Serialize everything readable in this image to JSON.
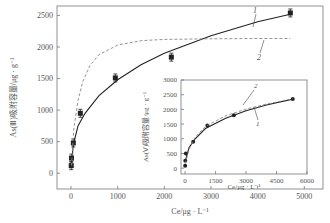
{
  "chart_data": [
    {
      "type": "scatter",
      "title": "",
      "xlabel": "Ce/μg·L⁻¹",
      "ylabel": "As(Ⅲ)吸附容量/μg·g⁻¹",
      "xlim": [
        -300,
        5400
      ],
      "ylim": [
        -250,
        2650
      ],
      "xticks": [
        0,
        1000,
        2000,
        3000,
        4000,
        5000
      ],
      "yticks": [
        0,
        500,
        1000,
        1500,
        2000,
        2500
      ],
      "grid": false,
      "series": [
        {
          "name": "data",
          "x": [
            5,
            10,
            50,
            200,
            950,
            2150,
            4700
          ],
          "y": [
            120,
            240,
            480,
            950,
            1510,
            1840,
            2540
          ],
          "marker": "square"
        },
        {
          "name": "1",
          "style": "solid",
          "x": [
            10,
            50,
            150,
            300,
            600,
            1000,
            1500,
            2000,
            3000,
            4000,
            4700
          ],
          "y": [
            150,
            450,
            750,
            950,
            1230,
            1480,
            1720,
            1900,
            2180,
            2400,
            2520
          ]
        },
        {
          "name": "2",
          "style": "dashed",
          "x": [
            10,
            60,
            150,
            250,
            400,
            600,
            1000,
            1500,
            2000,
            3000,
            4000,
            4700
          ],
          "y": [
            120,
            700,
            1150,
            1450,
            1700,
            1880,
            2030,
            2100,
            2120,
            2130,
            2135,
            2135
          ]
        }
      ],
      "annotations": [
        "1",
        "2"
      ]
    },
    {
      "type": "scatter",
      "title": "",
      "xlabel": "Ce/μg·L⁻¹",
      "ylabel": "As(Ⅴ)吸附容量/μg·g⁻¹",
      "xlim": [
        -200,
        6000
      ],
      "ylim": [
        -200,
        3000
      ],
      "xticks": [
        0,
        1500,
        3000,
        4500,
        6000
      ],
      "yticks": [
        0,
        500,
        1000,
        1500,
        2000,
        2500,
        3000
      ],
      "grid": false,
      "series": [
        {
          "name": "data",
          "x": [
            5,
            10,
            40,
            400,
            1100,
            2400,
            5300
          ],
          "y": [
            80,
            250,
            500,
            900,
            1450,
            1800,
            2350
          ],
          "marker": "circle"
        },
        {
          "name": "1",
          "style": "solid",
          "x": [
            10,
            200,
            500,
            1000,
            2000,
            3000,
            4000,
            5300
          ],
          "y": [
            250,
            700,
            1000,
            1350,
            1700,
            1950,
            2150,
            2350
          ]
        },
        {
          "name": "2",
          "style": "dashed",
          "x": [
            10,
            200,
            500,
            1000,
            2000,
            3000,
            4000,
            5300
          ],
          "y": [
            150,
            650,
            1050,
            1420,
            1780,
            2010,
            2180,
            2360
          ]
        }
      ],
      "annotations": [
        "1",
        "2"
      ]
    }
  ],
  "labels": {
    "main_ylabel": "As(Ⅲ)吸附容量/μg · g⁻¹",
    "main_xlabel": "Ce/μg · L⁻¹",
    "inset_ylabel": "As(Ⅴ)吸附容量/μg · g⁻¹",
    "inset_xlabel": "Ce/μg · L⁻¹",
    "curve1": "1",
    "curve2": "2"
  }
}
